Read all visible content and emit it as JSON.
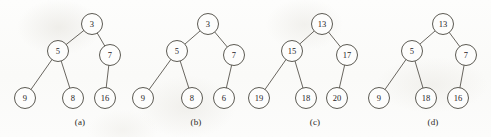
{
  "figure": {
    "background_color": "#fcfcfb",
    "node_fill_color": "#fdfdfc",
    "node_stroke_color": "#4a4740",
    "edge_color": "#58554e",
    "text_color": "#25231f",
    "node_radius": 10.5,
    "width": 491,
    "height": 137
  },
  "trees": [
    {
      "id": "tree-a",
      "caption": "(a)",
      "caption_x": 80,
      "caption_y": 122,
      "nodes": [
        {
          "id": "a-root",
          "role": "root",
          "value": "3",
          "x": 92,
          "y": 24
        },
        {
          "id": "a-left",
          "role": "left-child",
          "value": "5",
          "x": 58,
          "y": 51
        },
        {
          "id": "a-right",
          "role": "right-child",
          "value": "7",
          "x": 110,
          "y": 55
        },
        {
          "id": "a-ll",
          "role": "left-leaf",
          "value": "9",
          "x": 25,
          "y": 98
        },
        {
          "id": "a-lr",
          "role": "middle-leaf",
          "value": "8",
          "x": 73,
          "y": 98
        },
        {
          "id": "a-rl",
          "role": "right-leaf",
          "value": "16",
          "x": 105,
          "y": 98
        }
      ],
      "edges": [
        {
          "from": "a-root",
          "to": "a-left"
        },
        {
          "from": "a-root",
          "to": "a-right"
        },
        {
          "from": "a-left",
          "to": "a-ll"
        },
        {
          "from": "a-left",
          "to": "a-lr"
        },
        {
          "from": "a-right",
          "to": "a-rl"
        }
      ]
    },
    {
      "id": "tree-b",
      "caption": "(b)",
      "caption_x": 196,
      "caption_y": 122,
      "nodes": [
        {
          "id": "b-root",
          "role": "root",
          "value": "3",
          "x": 208,
          "y": 24
        },
        {
          "id": "b-left",
          "role": "left-child",
          "value": "5",
          "x": 177,
          "y": 51
        },
        {
          "id": "b-right",
          "role": "right-child",
          "value": "7",
          "x": 234,
          "y": 55
        },
        {
          "id": "b-ll",
          "role": "left-leaf",
          "value": "9",
          "x": 143,
          "y": 98
        },
        {
          "id": "b-lr",
          "role": "middle-leaf",
          "value": "8",
          "x": 192,
          "y": 98
        },
        {
          "id": "b-rl",
          "role": "right-leaf",
          "value": "6",
          "x": 224,
          "y": 98
        }
      ],
      "edges": [
        {
          "from": "b-root",
          "to": "b-left"
        },
        {
          "from": "b-root",
          "to": "b-right"
        },
        {
          "from": "b-left",
          "to": "b-ll"
        },
        {
          "from": "b-left",
          "to": "b-lr"
        },
        {
          "from": "b-right",
          "to": "b-rl"
        }
      ]
    },
    {
      "id": "tree-c",
      "caption": "(c)",
      "caption_x": 315,
      "caption_y": 122,
      "nodes": [
        {
          "id": "c-root",
          "role": "root",
          "value": "13",
          "x": 322,
          "y": 24
        },
        {
          "id": "c-left",
          "role": "left-child",
          "value": "15",
          "x": 292,
          "y": 51
        },
        {
          "id": "c-right",
          "role": "right-child",
          "value": "17",
          "x": 347,
          "y": 55
        },
        {
          "id": "c-ll",
          "role": "left-leaf",
          "value": "19",
          "x": 259,
          "y": 98
        },
        {
          "id": "c-lr",
          "role": "middle-leaf",
          "value": "18",
          "x": 306,
          "y": 98
        },
        {
          "id": "c-rl",
          "role": "right-leaf",
          "value": "20",
          "x": 337,
          "y": 98
        }
      ],
      "edges": [
        {
          "from": "c-root",
          "to": "c-left"
        },
        {
          "from": "c-root",
          "to": "c-right"
        },
        {
          "from": "c-left",
          "to": "c-ll"
        },
        {
          "from": "c-left",
          "to": "c-lr"
        },
        {
          "from": "c-right",
          "to": "c-rl"
        }
      ]
    },
    {
      "id": "tree-d",
      "caption": "(d)",
      "caption_x": 433,
      "caption_y": 122,
      "nodes": [
        {
          "id": "d-root",
          "role": "root",
          "value": "13",
          "x": 443,
          "y": 24
        },
        {
          "id": "d-left",
          "role": "left-child",
          "value": "5",
          "x": 412,
          "y": 51
        },
        {
          "id": "d-right",
          "role": "right-child",
          "value": "7",
          "x": 466,
          "y": 55
        },
        {
          "id": "d-ll",
          "role": "left-leaf",
          "value": "9",
          "x": 379,
          "y": 98
        },
        {
          "id": "d-lr",
          "role": "middle-leaf",
          "value": "18",
          "x": 426,
          "y": 98
        },
        {
          "id": "d-rl",
          "role": "right-leaf",
          "value": "16",
          "x": 458,
          "y": 98
        }
      ],
      "edges": [
        {
          "from": "d-root",
          "to": "d-left"
        },
        {
          "from": "d-root",
          "to": "d-right"
        },
        {
          "from": "d-left",
          "to": "d-ll"
        },
        {
          "from": "d-left",
          "to": "d-lr"
        },
        {
          "from": "d-right",
          "to": "d-rl"
        }
      ]
    }
  ]
}
